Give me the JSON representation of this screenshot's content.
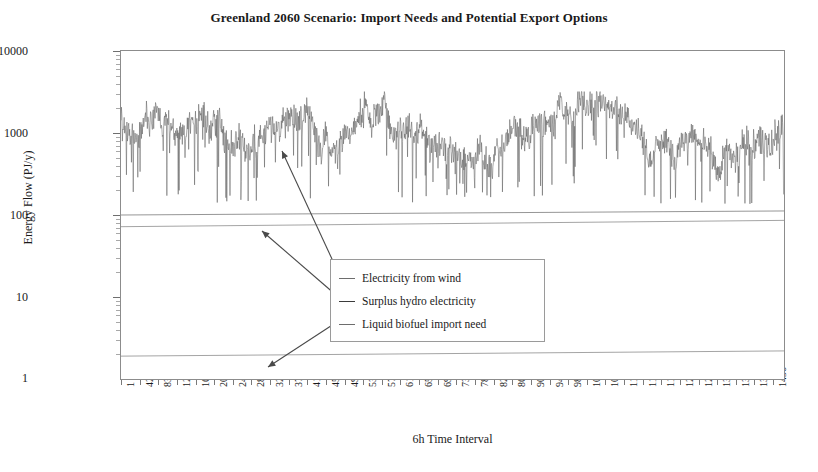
{
  "chart_data": {
    "type": "line",
    "title": "Greenland 2060 Scenario: Import Needs and Potential Export Options",
    "xlabel": "6h Time Interval",
    "ylabel": "Energy Flow (PJ/y)",
    "yscale": "log",
    "ylim": [
      1,
      10000
    ],
    "ytick_labels": [
      "10000",
      "1000",
      "100",
      "10"
    ],
    "ytick_values": [
      10000,
      1000,
      100,
      10
    ],
    "xlim": [
      1,
      1460
    ],
    "grid": false,
    "legend_position": "inside-center",
    "xtick_labels": [
      "1",
      "42",
      "83",
      "124",
      "165",
      "206",
      "247",
      "288",
      "329",
      "370",
      "411",
      "452",
      "493",
      "534",
      "575",
      "616",
      "657",
      "698",
      "739",
      "780",
      "821",
      "862",
      "903",
      "944",
      "985",
      "1026",
      "1067",
      "1108",
      "1149",
      "1190",
      "1231",
      "1272",
      "1313",
      "1354",
      "1395",
      "1436"
    ],
    "xtick_values": [
      1,
      42,
      83,
      124,
      165,
      206,
      247,
      288,
      329,
      370,
      411,
      452,
      493,
      534,
      575,
      616,
      657,
      698,
      739,
      780,
      821,
      862,
      903,
      944,
      985,
      1026,
      1067,
      1108,
      1149,
      1190,
      1231,
      1272,
      1313,
      1354,
      1395,
      1436
    ],
    "series": [
      {
        "name": "Electricity from wind",
        "color": "#5a5a5a",
        "type": "noisy-timeseries",
        "description": "High-frequency 6-hourly wind electricity output fluctuating roughly between 150 and 3000 PJ/y, centred near 1200 PJ/y, with frequent deep downward spikes to 150-400 PJ/y",
        "center": 1250,
        "band_low": 700,
        "band_high": 2600,
        "spike_min": 150,
        "n_points": 1460
      },
      {
        "name": "Surplus hydro electricity",
        "color": "#8a8a8a",
        "type": "near-constant",
        "description": "Almost flat line rising very slightly from about 100 to 112 PJ/y across the year",
        "y_start": 100,
        "y_end": 112
      },
      {
        "name": "Liquid biofuel import need",
        "color": "#9a9a9a",
        "type": "near-constant",
        "description": "Almost flat line just above the axis minimum, rising slightly from about 1.9 to 2.2 PJ/y",
        "y_start": 1.9,
        "y_end": 2.2
      },
      {
        "name": "secondary-flat-line",
        "color": "#9a9a9a",
        "type": "near-constant",
        "description": "Second nearly flat line below the surplus hydro line, rising from about 72 to 86 PJ/y",
        "y_start": 72,
        "y_end": 86
      }
    ],
    "annotations": [
      {
        "label": "Electricity from wind",
        "points_to": "wind-series",
        "style": "arrow"
      },
      {
        "label": "Surplus hydro electricity",
        "points_to": "hydro-line",
        "style": "arrow"
      },
      {
        "label": "Liquid biofuel import need",
        "points_to": "biofuel-line",
        "style": "arrow"
      }
    ]
  },
  "legend": {
    "items": [
      {
        "label": "Electricity from wind"
      },
      {
        "label": "Surplus hydro electricity"
      },
      {
        "label": "Liquid biofuel import need"
      }
    ]
  }
}
